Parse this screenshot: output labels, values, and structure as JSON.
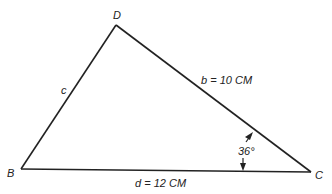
{
  "diagram": {
    "type": "triangle",
    "vertices": {
      "D": {
        "label": "D",
        "x": 116,
        "y": 25
      },
      "B": {
        "label": "B",
        "x": 21,
        "y": 169
      },
      "C": {
        "label": "C",
        "x": 311,
        "y": 172
      }
    },
    "sides": {
      "c": {
        "label": "c",
        "from": "B",
        "to": "D"
      },
      "b": {
        "label": "b = 10 CM",
        "from": "D",
        "to": "C"
      },
      "d": {
        "label": "d = 12 CM",
        "from": "B",
        "to": "C"
      }
    },
    "angle": {
      "vertex": "C",
      "label": "36°"
    }
  }
}
